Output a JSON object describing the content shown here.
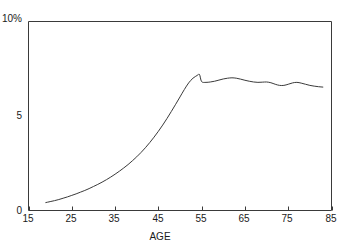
{
  "chart_data": {
    "type": "line",
    "title": "",
    "subtitle": "",
    "xlabel": "AGE",
    "ylabel": "",
    "ylabel_top": "10%",
    "xlim": [
      15,
      85
    ],
    "ylim": [
      0,
      10
    ],
    "grid": false,
    "legend": null,
    "xticks": [
      15,
      25,
      35,
      45,
      55,
      65,
      75,
      85
    ],
    "xtick_labels": [
      "15",
      "25",
      "35",
      "45",
      "55",
      "65",
      "75",
      "85"
    ],
    "yticks": [
      0,
      5,
      10
    ],
    "ytick_labels": [
      "0",
      "5",
      "10%"
    ],
    "line_color": "#3a3a3a",
    "axis_color": "#3a3a3a",
    "background_color": "#ffffff",
    "series": [
      {
        "name": "prevalence",
        "x": [
          19,
          20,
          21,
          22,
          23,
          24,
          25,
          26,
          27,
          28,
          29,
          30,
          31,
          32,
          33,
          34,
          35,
          36,
          37,
          38,
          39,
          40,
          41,
          42,
          43,
          44,
          45,
          46,
          47,
          48,
          49,
          50,
          51,
          52,
          53,
          54,
          54.5,
          55,
          56,
          57,
          58,
          59,
          60,
          61,
          62,
          63,
          64,
          65,
          66,
          67,
          68,
          69,
          70,
          71,
          72,
          73,
          74,
          75,
          76,
          77,
          78,
          79,
          80,
          81,
          82,
          83
        ],
        "y": [
          0.42,
          0.47,
          0.52,
          0.58,
          0.65,
          0.72,
          0.8,
          0.88,
          0.97,
          1.06,
          1.16,
          1.27,
          1.38,
          1.5,
          1.63,
          1.77,
          1.92,
          2.08,
          2.25,
          2.43,
          2.63,
          2.84,
          3.07,
          3.32,
          3.59,
          3.88,
          4.19,
          4.52,
          4.87,
          5.24,
          5.62,
          6.01,
          6.4,
          6.75,
          7.0,
          7.15,
          7.2,
          6.82,
          6.78,
          6.8,
          6.84,
          6.9,
          6.96,
          7.0,
          7.02,
          7.0,
          6.95,
          6.89,
          6.84,
          6.8,
          6.78,
          6.79,
          6.8,
          6.76,
          6.68,
          6.62,
          6.62,
          6.68,
          6.75,
          6.78,
          6.74,
          6.68,
          6.62,
          6.58,
          6.55,
          6.53
        ]
      }
    ]
  }
}
